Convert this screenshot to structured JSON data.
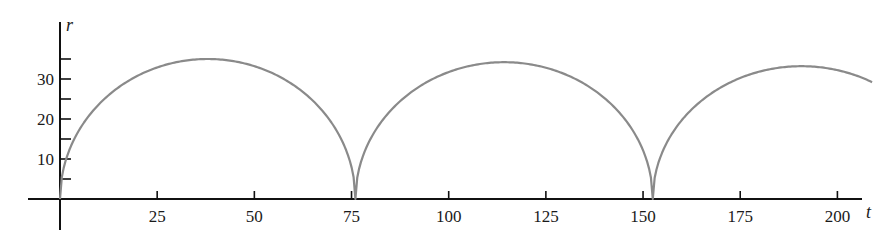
{
  "chart_data": {
    "type": "line",
    "title": "",
    "xlabel": "t",
    "ylabel": "r",
    "xlim": [
      -8,
      210
    ],
    "ylim": [
      -8,
      44
    ],
    "grid": false,
    "legend": null,
    "x_ticks": [
      25,
      50,
      75,
      100,
      125,
      150,
      175,
      200
    ],
    "x_tick_labels": [
      "25",
      "50",
      "75",
      "100",
      "125",
      "150",
      "175",
      "200"
    ],
    "y_ticks_major": [
      10,
      20,
      30
    ],
    "y_tick_labels": [
      "10",
      "20",
      "30"
    ],
    "y_ticks_minor": [
      5,
      15,
      25,
      35
    ],
    "series": [
      {
        "name": "r(t)",
        "color": "#8a8a8a",
        "description": "Three semicircular arches touching r=0 at t≈0, 76, 152; peak heights slowly decreasing",
        "arches": [
          {
            "t_start": 0,
            "t_end": 76,
            "peak_t": 38,
            "peak_r": 35
          },
          {
            "t_start": 76,
            "t_end": 152.5,
            "peak_t": 114.5,
            "peak_r": 34.2
          },
          {
            "t_start": 152.5,
            "t_end": 229,
            "peak_t": 190.5,
            "peak_r": 33.2
          }
        ],
        "x": [
          0,
          2.6,
          6,
          10,
          18.5,
          25,
          38,
          50,
          60,
          70,
          76,
          80,
          90,
          100,
          114.5,
          125,
          140,
          150,
          152.5,
          156,
          165,
          175,
          190.5,
          200,
          209
        ],
        "values": [
          0,
          10,
          20,
          24.6,
          30,
          32.3,
          35,
          33.4,
          28.4,
          18.3,
          0,
          14.9,
          25.6,
          31.5,
          34.2,
          33.0,
          25.8,
          12.5,
          0,
          13.4,
          24.9,
          30.3,
          33.2,
          32.2,
          27
        ]
      }
    ]
  }
}
